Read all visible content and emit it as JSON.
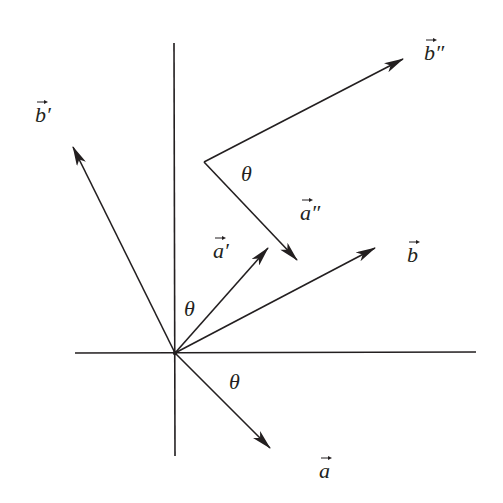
{
  "diagram": {
    "colors": {
      "stroke": "#231f20",
      "background": "#ffffff"
    },
    "axes": {
      "vertical": {
        "x1": 174,
        "y1": 43,
        "x2": 175,
        "y2": 456
      },
      "horizontal": {
        "x1": 75,
        "y1": 353,
        "x2": 476,
        "y2": 352
      }
    },
    "origin": {
      "x": 175,
      "y": 353
    },
    "vectors": [
      {
        "name": "b-prime",
        "x1": 175,
        "y1": 353,
        "x2": 73,
        "y2": 147,
        "label": "b′",
        "label_x": 35,
        "label_y": 122
      },
      {
        "name": "a-prime",
        "x1": 175,
        "y1": 353,
        "x2": 268,
        "y2": 248,
        "label": "a′",
        "label_x": 213,
        "label_y": 258
      },
      {
        "name": "b",
        "x1": 175,
        "y1": 353,
        "x2": 375,
        "y2": 248,
        "label": "b",
        "label_x": 407,
        "label_y": 262
      },
      {
        "name": "a",
        "x1": 175,
        "y1": 353,
        "x2": 270,
        "y2": 448,
        "label": "a",
        "label_x": 319,
        "label_y": 478
      },
      {
        "name": "b-double-prime",
        "x1": 204,
        "y1": 162,
        "x2": 403,
        "y2": 59,
        "label": "b″",
        "label_x": 424,
        "label_y": 60
      },
      {
        "name": "a-double-prime",
        "x1": 204,
        "y1": 162,
        "x2": 297,
        "y2": 260,
        "label": "a″",
        "label_x": 300,
        "label_y": 220
      }
    ],
    "angle_labels": [
      {
        "text": "θ",
        "x": 241,
        "y": 181
      },
      {
        "text": "θ",
        "x": 184,
        "y": 316
      },
      {
        "text": "θ",
        "x": 229,
        "y": 389
      }
    ]
  }
}
